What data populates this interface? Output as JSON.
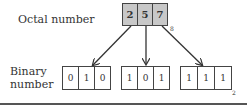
{
  "octal": {
    "label": "Octal number",
    "digits": [
      "2",
      "5",
      "7"
    ],
    "base_subscript": "8",
    "fill_color": "#c8c8c8"
  },
  "binary": {
    "label_line1": "Binary",
    "label_line2": "number",
    "groups": [
      [
        "0",
        "1",
        "0"
      ],
      [
        "1",
        "0",
        "1"
      ],
      [
        "1",
        "1",
        "1"
      ]
    ],
    "base_subscript": "2"
  }
}
